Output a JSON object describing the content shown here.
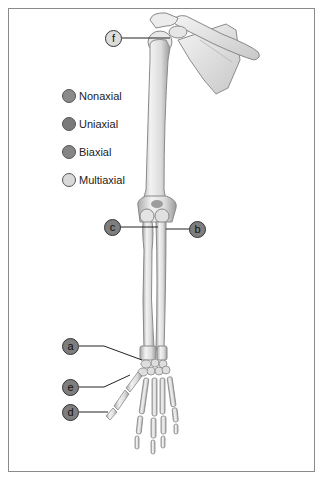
{
  "figure": {
    "legend": {
      "items": [
        {
          "label": "Nonaxial",
          "color": "#8a8a8a"
        },
        {
          "label": "Uniaxial",
          "color": "#7a7a7a"
        },
        {
          "label": "Biaxial",
          "color": "#858585"
        },
        {
          "label": "Multiaxial",
          "color": "#d9d9d9"
        }
      ]
    },
    "callouts": [
      {
        "letter": "f",
        "style": "light",
        "target": "shoulder joint"
      },
      {
        "letter": "c",
        "style": "dark",
        "target": "elbow joint (humeroulnar)"
      },
      {
        "letter": "b",
        "style": "dark",
        "target": "proximal radioulnar joint"
      },
      {
        "letter": "a",
        "style": "dark",
        "target": "wrist / intercarpal joint"
      },
      {
        "letter": "e",
        "style": "dark",
        "target": "carpometacarpal joint of thumb"
      },
      {
        "letter": "d",
        "style": "dark",
        "target": "interphalangeal joint"
      }
    ]
  }
}
